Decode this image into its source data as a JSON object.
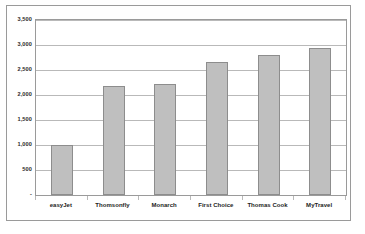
{
  "chart_data": {
    "type": "bar",
    "title": "",
    "subtitle": "",
    "xlabel": "",
    "ylabel": "",
    "categories": [
      "easyJet",
      "Thomsonfly",
      "Monarch",
      "First Choice",
      "Thomas Cook",
      "MyTravel"
    ],
    "values": [
      1010,
      2190,
      2225,
      2665,
      2810,
      2945
    ],
    "series": [
      {
        "name": "",
        "values": [
          1010,
          2190,
          2225,
          2665,
          2810,
          2945
        ]
      }
    ],
    "ylim": [
      0,
      3500
    ],
    "yticks": [
      0,
      500,
      1000,
      1500,
      2000,
      2500,
      3000,
      3500
    ],
    "ytick_labels": [
      "-",
      "500",
      "1,000",
      "1,500",
      "2,000",
      "2,500",
      "3,000",
      "3,500"
    ],
    "grid": true,
    "legend": false,
    "legend_position": "none",
    "bar_color": "#bfbfbf",
    "bar_border_color": "#8d8d8d",
    "gridline_color": "#b9b9b9",
    "axis_color": "#9a9a9a",
    "plot_background": "#ffffff"
  }
}
